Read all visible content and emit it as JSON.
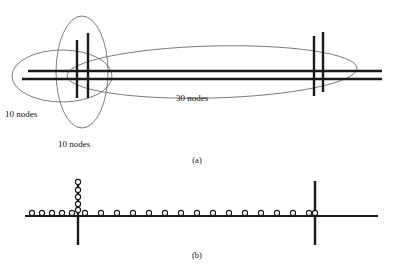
{
  "figure": {
    "background": "#ffffff",
    "ink": "#1a1a1a",
    "thin_ink": "#5a5a5a",
    "panel_a": {
      "caption": "(a)",
      "caption_pos": {
        "x": 197,
        "y": 163
      },
      "labels": [
        {
          "id": "left-cluster-label",
          "text": "10 nodes",
          "x": 5,
          "y": 117
        },
        {
          "id": "vertical-cluster-label",
          "text": "10 nodes",
          "x": 58,
          "y": 147
        },
        {
          "id": "backbone-label",
          "text": "30 nodes",
          "x": 176,
          "y": 101
        }
      ],
      "horizontal_lines": [
        {
          "id": "bus-upper",
          "x1": 28,
          "y1": 71,
          "x2": 382,
          "y2": 71,
          "width": 2.4
        },
        {
          "id": "bus-lower",
          "x1": 22,
          "y1": 79,
          "x2": 382,
          "y2": 79,
          "width": 2.4
        }
      ],
      "vertical_bars": [
        {
          "id": "left-bar-inner",
          "x": 77,
          "y1": 40,
          "y2": 98,
          "width": 2.4
        },
        {
          "id": "left-bar-outer",
          "x": 88,
          "y1": 33,
          "y2": 98,
          "width": 2.4
        },
        {
          "id": "right-bar-inner",
          "x": 314,
          "y1": 36,
          "y2": 96,
          "width": 2.4
        },
        {
          "id": "right-bar-outer",
          "x": 323,
          "y1": 32,
          "y2": 92,
          "width": 2.4
        }
      ],
      "ellipses": [
        {
          "id": "ellipse-left-cluster",
          "cx": 62,
          "cy": 76,
          "rx": 50,
          "ry": 26,
          "rotation": 0
        },
        {
          "id": "ellipse-vertical-cluster",
          "cx": 82,
          "cy": 72,
          "rx": 26,
          "ry": 56,
          "rotation": 0
        },
        {
          "id": "ellipse-backbone",
          "cx": 212,
          "cy": 72,
          "rx": 145,
          "ry": 26,
          "rotation": -1.5
        }
      ]
    },
    "panel_b": {
      "caption": "(b)",
      "caption_pos": {
        "x": 197,
        "y": 258
      },
      "axis_line": {
        "id": "bus-line",
        "x1": 25,
        "y1": 216,
        "x2": 378,
        "y2": 216,
        "width": 2.2
      },
      "vertical_bars": [
        {
          "id": "left-switch-bar",
          "x": 78,
          "y1": 181,
          "y2": 245,
          "width": 2.4
        },
        {
          "id": "right-switch-bar",
          "x": 315,
          "y1": 181,
          "y2": 245,
          "width": 2.4
        }
      ],
      "horizontal_node_xs": [
        32,
        42,
        52,
        62,
        72,
        85,
        101,
        117,
        133,
        149,
        165,
        181,
        197,
        213,
        229,
        245,
        261,
        277,
        293,
        309,
        315
      ],
      "vertical_node_ys": [
        182,
        190,
        197,
        204,
        210
      ],
      "vertical_node_x": 78,
      "node_radius": 2.6,
      "node_counts": {
        "left_cluster": 10,
        "vertical_cluster": 10,
        "backbone": 30
      }
    }
  }
}
